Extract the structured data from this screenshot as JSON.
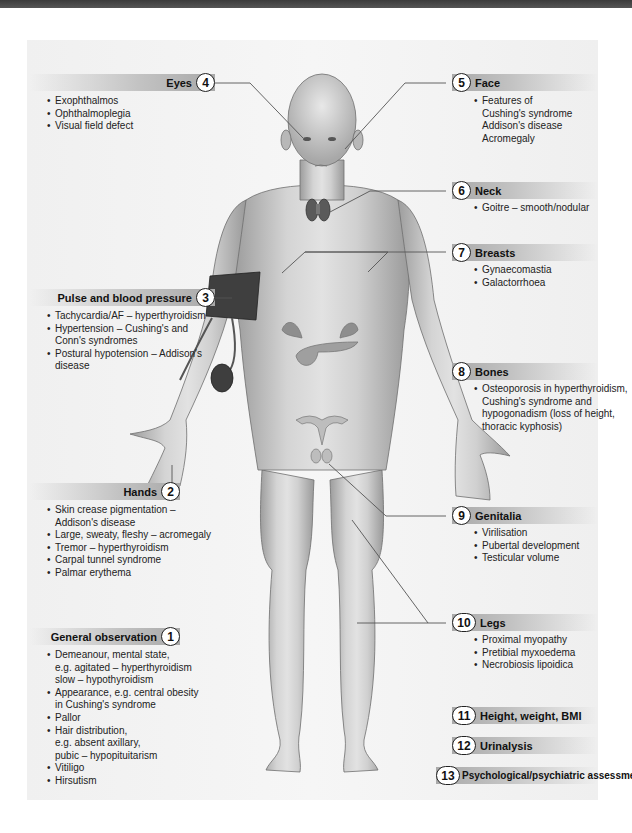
{
  "colors": {
    "top_bar": "#444444",
    "panel_bg": "#f2f2f2",
    "header_band": "#b0b0b0",
    "skin": "#c9c9c9",
    "leader_line": "#444444"
  },
  "sections": {
    "eyes": {
      "number": "4",
      "title": "Eyes",
      "items": [
        "Exophthalmos",
        "Ophthalmoplegia",
        "Visual field defect"
      ]
    },
    "face": {
      "number": "5",
      "title": "Face",
      "items": [
        "Features of",
        "Cushing's syndrome",
        "Addison's disease",
        "Acromegaly"
      ]
    },
    "neck": {
      "number": "6",
      "title": "Neck",
      "items": [
        "Goitre – smooth/nodular"
      ]
    },
    "breasts": {
      "number": "7",
      "title": "Breasts",
      "items": [
        "Gynaecomastia",
        "Galactorrhoea"
      ]
    },
    "pulse": {
      "number": "3",
      "title": "Pulse and blood pressure",
      "items": [
        "Tachycardia/AF – hyperthyroidism",
        "Hypertension – Cushing's and",
        "Conn's syndromes",
        "Postural hypotension – Addison's",
        "disease"
      ]
    },
    "bones": {
      "number": "8",
      "title": "Bones",
      "items": [
        "Osteoporosis in hyperthyroidism,",
        "Cushing's syndrome and",
        "hypogonadism (loss of height,",
        "thoracic kyphosis)"
      ]
    },
    "hands": {
      "number": "2",
      "title": "Hands",
      "items": [
        "Skin crease pigmentation –",
        "Addison's disease",
        "Large, sweaty, fleshy – acromegaly",
        "Tremor – hyperthyroidism",
        "Carpal tunnel syndrome",
        "Palmar erythema"
      ]
    },
    "genitalia": {
      "number": "9",
      "title": "Genitalia",
      "items": [
        "Virilisation",
        "Pubertal development",
        "Testicular volume"
      ]
    },
    "general": {
      "number": "1",
      "title": "General observation",
      "items": [
        "Demeanour, mental state,",
        "e.g. agitated – hyperthyroidism",
        "slow – hypothyroidism",
        "Appearance, e.g. central obesity",
        "in Cushing's syndrome",
        "Pallor",
        "Hair distribution,",
        "e.g. absent axillary,",
        "pubic – hypopituitarism",
        "Vitiligo",
        "Hirsutism"
      ]
    },
    "legs": {
      "number": "10",
      "title": "Legs",
      "items": [
        "Proximal myopathy",
        "Pretibial myxoedema",
        "Necrobiosis lipoidica"
      ]
    },
    "hwbmi": {
      "number": "11",
      "title": "Height, weight, BMI"
    },
    "urinalysis": {
      "number": "12",
      "title": "Urinalysis"
    },
    "psych": {
      "number": "13",
      "title": "Psychological/psychiatric assessment"
    }
  }
}
